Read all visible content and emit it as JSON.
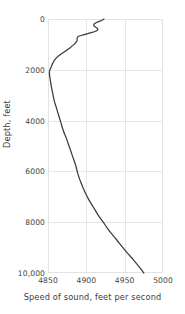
{
  "chart_data": {
    "type": "line",
    "title": "",
    "xlabel": "Speed of sound, feet per second",
    "ylabel": "Depth, feet",
    "xlim": [
      4850,
      5000
    ],
    "ylim": [
      0,
      10000
    ],
    "y_inverted": true,
    "grid": true,
    "legend": null,
    "xticks": [
      4850,
      4900,
      4950,
      5000
    ],
    "xtick_labels": [
      "4850",
      "4900",
      "4950",
      "5000"
    ],
    "yticks": [
      0,
      2000,
      4000,
      6000,
      8000,
      10000
    ],
    "ytick_labels": [
      "0",
      "2000",
      "4000",
      "6000",
      "8000",
      "10,000"
    ],
    "line_color": "#3b3b3b",
    "series": [
      {
        "name": "sound speed profile",
        "x": [
          4923,
          4920,
          4914,
          4910,
          4910,
          4913,
          4915,
          4913,
          4905,
          4894,
          4889,
          4888,
          4888,
          4887,
          4884,
          4878,
          4871,
          4864,
          4859,
          4856,
          4854,
          4852,
          4852,
          4853,
          4854,
          4856,
          4858,
          4861,
          4864,
          4867,
          4870,
          4874,
          4878,
          4882,
          4886,
          4889,
          4893,
          4898,
          4903,
          4909,
          4915,
          4922,
          4929,
          4937,
          4945,
          4953,
          4962,
          4970,
          4975
        ],
        "y": [
          0,
          60,
          130,
          200,
          270,
          340,
          400,
          470,
          550,
          640,
          700,
          760,
          830,
          900,
          1000,
          1150,
          1300,
          1450,
          1600,
          1750,
          1900,
          2050,
          2200,
          2400,
          2600,
          2900,
          3200,
          3500,
          3800,
          4100,
          4400,
          4700,
          5050,
          5400,
          5750,
          6100,
          6450,
          6800,
          7100,
          7400,
          7700,
          8000,
          8300,
          8600,
          8900,
          9200,
          9500,
          9800,
          10000
        ]
      }
    ]
  }
}
